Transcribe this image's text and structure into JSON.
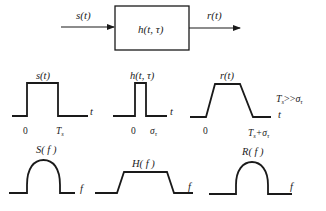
{
  "system": {
    "input_label": "s(t)",
    "block_label": "h(t, τ)",
    "output_label": "r(t)"
  },
  "time_domain": {
    "panels": [
      {
        "id": "s",
        "title": "s(t)",
        "axis": "t",
        "ticks": [
          "0",
          "T",
          "s"
        ]
      },
      {
        "id": "h",
        "title": "h(t, τ)",
        "axis": "t",
        "ticks": [
          "0",
          "σ",
          "τ"
        ]
      },
      {
        "id": "r",
        "title": "r(t)",
        "axis": "",
        "ticks": [
          "0",
          "T",
          "s",
          "+σ",
          "τ"
        ]
      }
    ],
    "condition": {
      "lhs": "T",
      "lhs_sub": "s",
      "op": ">>",
      "rhs": "σ",
      "rhs_sub": "τ"
    }
  },
  "freq_domain": {
    "panels": [
      {
        "id": "S",
        "title": "S( f )",
        "axis": "f"
      },
      {
        "id": "H",
        "title": "H( f )",
        "axis": "f"
      },
      {
        "id": "R",
        "title": "R( f )",
        "axis": "f"
      }
    ]
  },
  "colors": {
    "stroke": "#1a1a1a",
    "text": "#222222",
    "background": "#ffffff"
  }
}
